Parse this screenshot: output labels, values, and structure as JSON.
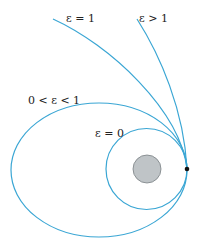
{
  "diagram": {
    "labels": {
      "parabola": "ε = 1",
      "hyperbola": "ε > 1",
      "ellipse": "0 < ε < 1",
      "circle": "ε = 0"
    },
    "colors": {
      "orbit": "#3aa6d4",
      "planet_fill": "#bfc4c7",
      "planet_stroke": "#7a8084",
      "contact_point": "#111111"
    }
  }
}
